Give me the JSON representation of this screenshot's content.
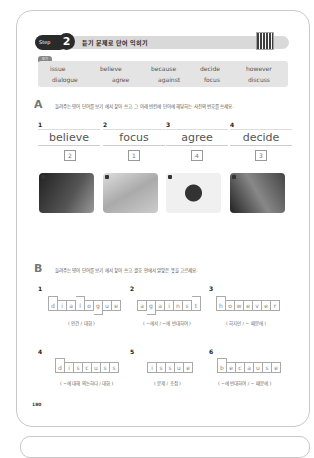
{
  "header": {
    "step_label": "Step",
    "step_number": "2",
    "title": "듣기 문제로 단어 익히기",
    "qr_icon": "qr-code-icon"
  },
  "word_bank": {
    "label": "보기",
    "words": [
      "issue",
      "believe",
      "because",
      "decide",
      "however",
      "dialogue",
      "agree",
      "against",
      "focus",
      "discuss"
    ]
  },
  "section_a": {
    "letter": "A",
    "instruction": "들려주는 영어 단어를 보기 에서 찾아 쓰고, 그 아래 빈칸에 단어에 해당하는 사진의 번호를 쓰세요.",
    "bogi_label": "보기",
    "items": [
      {
        "num": "1",
        "answer": "believe",
        "photo_num": "2"
      },
      {
        "num": "2",
        "answer": "focus",
        "photo_num": "1"
      },
      {
        "num": "3",
        "answer": "agree",
        "photo_num": "4"
      },
      {
        "num": "4",
        "answer": "decide",
        "photo_num": "3"
      }
    ],
    "photos": [
      {
        "tag": "1",
        "desc": "person studying at desk",
        "color": "#3a3a3a"
      },
      {
        "tag": "2",
        "desc": "hands clasped",
        "color": "#bdbdbd"
      },
      {
        "tag": "3",
        "desc": "businessman pointing",
        "color": "#e8e8e8"
      },
      {
        "tag": "4",
        "desc": "people shaking hands",
        "color": "#6d6d6d"
      }
    ]
  },
  "section_b": {
    "letter": "B",
    "instruction": "들려주는 영어 단어를 보기 에서 찾아 쓰고, 괄호 안에서 알맞은 뜻을 고르세요.",
    "bogi_label": "보기",
    "items": [
      {
        "num": "1",
        "letters": [
          "d",
          "i",
          "a",
          "l",
          "o",
          "g",
          "u",
          "e"
        ],
        "meaning": "( 안건 / 대화 )"
      },
      {
        "num": "2",
        "letters": [
          "a",
          "g",
          "a",
          "i",
          "n",
          "s",
          "t"
        ],
        "meaning": "( ~에서 / ~에 반대하여 )"
      },
      {
        "num": "3",
        "letters": [
          "h",
          "o",
          "w",
          "e",
          "v",
          "e",
          "r"
        ],
        "meaning": "( 하지만 / ~ 때문에 )"
      },
      {
        "num": "4",
        "letters": [
          "d",
          "i",
          "s",
          "c",
          "u",
          "s",
          "s"
        ],
        "meaning": "( ~에 대해 의논하다 / 대화 )"
      },
      {
        "num": "5",
        "letters": [
          "i",
          "s",
          "s",
          "u",
          "e"
        ],
        "meaning": "( 문제 / 초점 )"
      },
      {
        "num": "6",
        "letters": [
          "b",
          "e",
          "c",
          "a",
          "u",
          "s",
          "e"
        ],
        "meaning": "( ~에 반대하여 / ~ 때문에 )"
      }
    ]
  },
  "page_number": "180"
}
